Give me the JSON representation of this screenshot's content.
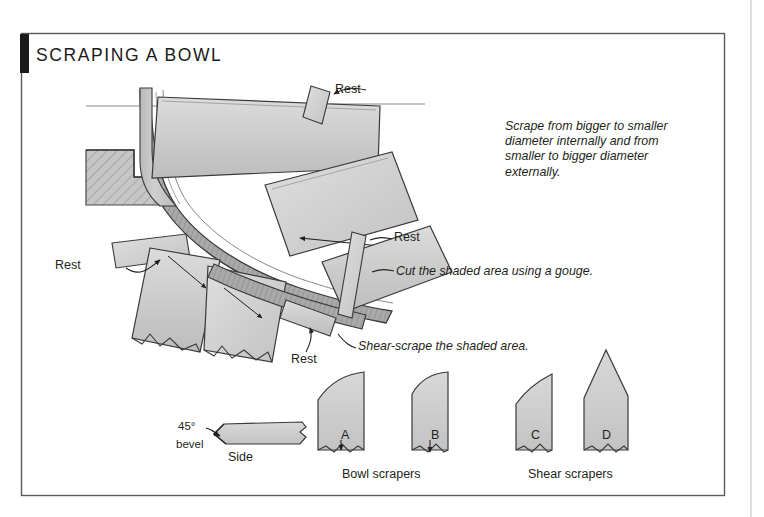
{
  "figure": {
    "title": "SCRAPING A BOWL",
    "frame": {
      "tab_color": "#1a1a1a",
      "border_color": "#5b5b5b",
      "page_rule_color": "#c9c9c9"
    },
    "palette": {
      "tool_fill": "#cccccc",
      "tool_fill_light": "#d6d6d6",
      "bowl_fill": "#c4c4c4",
      "bowl_shaded": "#9a9a9a",
      "hatch_fill": "#bdbdbd",
      "outline": "#3a3a3a",
      "centerline": "#8a8a8a"
    }
  },
  "callouts": {
    "rest_top": "Rest",
    "rest_mid": "Rest",
    "rest_left": "Rest",
    "rest_bottom": "Rest"
  },
  "notes": {
    "direction": "Scrape from bigger to smaller diameter internally and from smaller to bigger diameter externally.",
    "direction_lines": [
      "Scrape from bigger to smaller",
      "diameter internally and from",
      "smaller to bigger diameter",
      "externally."
    ],
    "gouge": "Cut the shaded area using a gouge.",
    "shear": "Shear-scrape the shaded area."
  },
  "side_view": {
    "angle_label": "45°",
    "bevel_label": "bevel",
    "view_label": "Side"
  },
  "scrapers": {
    "items": [
      {
        "id": "A",
        "label": "A",
        "group": "bowl",
        "profile": "square-round-corner"
      },
      {
        "id": "B",
        "label": "B",
        "group": "bowl",
        "profile": "round-nose"
      },
      {
        "id": "C",
        "label": "C",
        "group": "shear",
        "profile": "angled-skew"
      },
      {
        "id": "D",
        "label": "D",
        "group": "shear",
        "profile": "spear-point"
      }
    ],
    "groups": [
      {
        "key": "bowl",
        "label": "Bowl scrapers"
      },
      {
        "key": "shear",
        "label": "Shear scrapers"
      }
    ]
  }
}
